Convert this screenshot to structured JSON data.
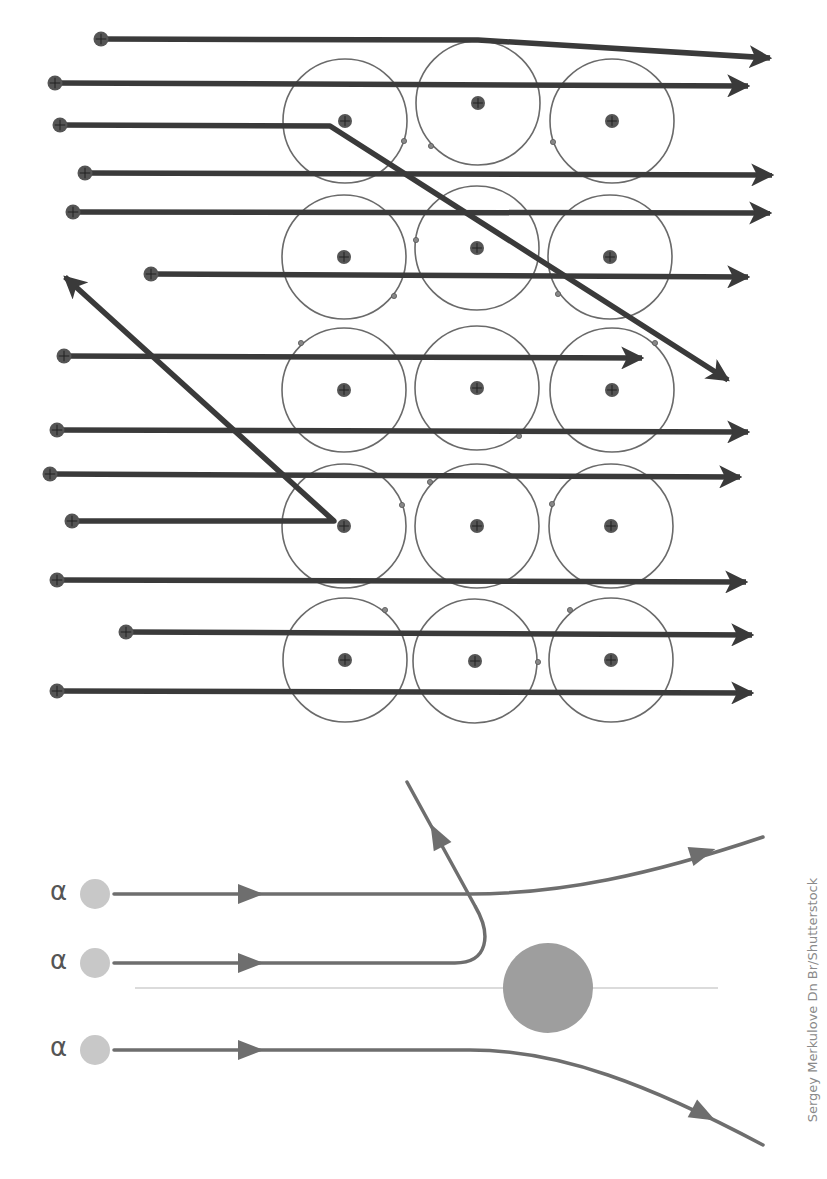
{
  "credit": "Sergey Merkulove Dn Br/Shutterstock",
  "colors": {
    "ray": "#3a3a3a",
    "orbit": "#6a6a6a",
    "nucleus": "#555555",
    "alpha_particle": "#c8c8c8",
    "trajectory": "#6e6e6e",
    "target_nucleus": "#9e9e9e",
    "axis": "#cfcfcf"
  },
  "top_diagram": {
    "atoms": [
      {
        "cx": 345,
        "cy": 121,
        "r": 62
      },
      {
        "cx": 478,
        "cy": 103,
        "r": 62
      },
      {
        "cx": 612,
        "cy": 121,
        "r": 62
      },
      {
        "cx": 344,
        "cy": 257,
        "r": 62
      },
      {
        "cx": 477,
        "cy": 248,
        "r": 62
      },
      {
        "cx": 610,
        "cy": 257,
        "r": 62
      },
      {
        "cx": 344,
        "cy": 390,
        "r": 62
      },
      {
        "cx": 477,
        "cy": 388,
        "r": 62
      },
      {
        "cx": 612,
        "cy": 390,
        "r": 62
      },
      {
        "cx": 344,
        "cy": 526,
        "r": 62
      },
      {
        "cx": 477,
        "cy": 526,
        "r": 62
      },
      {
        "cx": 611,
        "cy": 526,
        "r": 62
      },
      {
        "cx": 345,
        "cy": 660,
        "r": 62
      },
      {
        "cx": 475,
        "cy": 661,
        "r": 62
      },
      {
        "cx": 611,
        "cy": 660,
        "r": 62
      }
    ],
    "electrons": [
      [
        404,
        141
      ],
      [
        431,
        146
      ],
      [
        553,
        142
      ],
      [
        416,
        240
      ],
      [
        394,
        296
      ],
      [
        558,
        294
      ],
      [
        301,
        343
      ],
      [
        519,
        436
      ],
      [
        655,
        343
      ],
      [
        402,
        505
      ],
      [
        430,
        482
      ],
      [
        552,
        504
      ],
      [
        385,
        610
      ],
      [
        538,
        662
      ],
      [
        570,
        610
      ]
    ],
    "rays": [
      {
        "points": [
          [
            101,
            39
          ],
          [
            478,
            40
          ],
          [
            770,
            58
          ]
        ]
      },
      {
        "points": [
          [
            55,
            83
          ],
          [
            748,
            86
          ]
        ]
      },
      {
        "points": [
          [
            60,
            125
          ],
          [
            330,
            126
          ],
          [
            728,
            380
          ]
        ]
      },
      {
        "points": [
          [
            85,
            173
          ],
          [
            772,
            175
          ]
        ]
      },
      {
        "points": [
          [
            73,
            212
          ],
          [
            770,
            213
          ]
        ]
      },
      {
        "points": [
          [
            151,
            274
          ],
          [
            748,
            277
          ]
        ]
      },
      {
        "points": [
          [
            64,
            356
          ],
          [
            642,
            358
          ]
        ]
      },
      {
        "points": [
          [
            57,
            430
          ],
          [
            748,
            432
          ]
        ]
      },
      {
        "points": [
          [
            50,
            474
          ],
          [
            740,
            477
          ]
        ]
      },
      {
        "points": [
          [
            72,
            521
          ],
          [
            334,
            521
          ],
          [
            65,
            277
          ]
        ]
      },
      {
        "points": [
          [
            57,
            580
          ],
          [
            746,
            582
          ]
        ]
      },
      {
        "points": [
          [
            126,
            632
          ],
          [
            752,
            635
          ]
        ]
      },
      {
        "points": [
          [
            57,
            691
          ],
          [
            752,
            693
          ]
        ]
      }
    ]
  },
  "bottom_diagram": {
    "particles": [
      {
        "label": "α",
        "x": 95,
        "y": 894
      },
      {
        "label": "α",
        "x": 95,
        "y": 963
      },
      {
        "label": "α",
        "x": 95,
        "y": 1050
      }
    ],
    "target_nucleus": {
      "cx": 548,
      "cy": 988,
      "r": 45
    },
    "axis_line": {
      "x1": 135,
      "y1": 988,
      "x2": 718,
      "y2": 988
    },
    "trajectories": [
      {
        "name": "deflected-up",
        "path": "M114 894 L470 894 C560 894 650 875 763 837",
        "arrows": [
          [
            250,
            894,
            0
          ],
          [
            702,
            853,
            -17
          ]
        ]
      },
      {
        "name": "back-scattered",
        "path": "M114 963 L455 963 C488 963 492 935 475 906 L407 782",
        "arrows": [
          [
            250,
            963,
            0
          ],
          [
            437,
            836,
            -118
          ]
        ]
      },
      {
        "name": "deflected-down",
        "path": "M114 1050 L470 1050 C560 1050 650 1085 763 1145",
        "arrows": [
          [
            250,
            1050,
            0
          ],
          [
            703,
            1114,
            28
          ]
        ]
      }
    ]
  }
}
